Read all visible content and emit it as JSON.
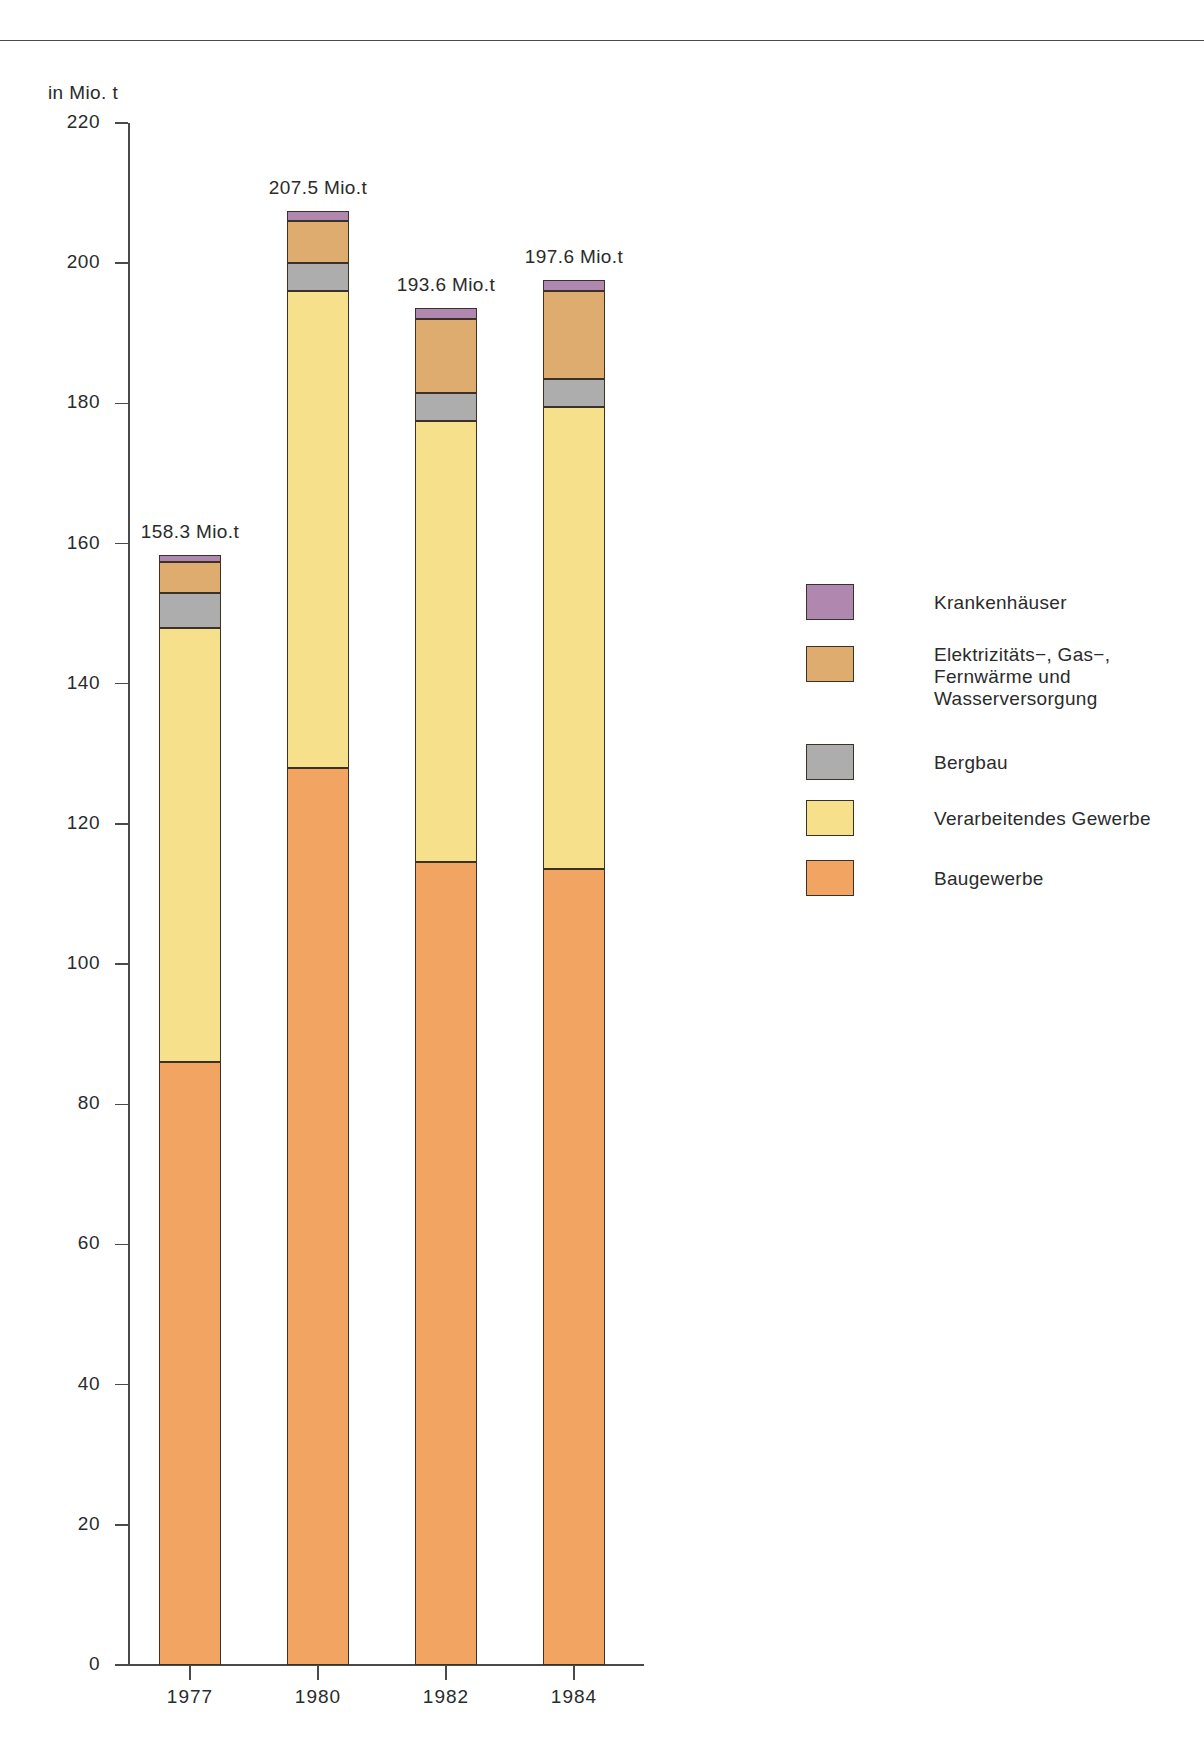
{
  "chart_data": {
    "type": "bar",
    "subtype": "stacked-bar",
    "title": "",
    "xlabel": "",
    "ylabel": "in Mio. t",
    "yunit": "in Mio. t",
    "ylim": [
      0,
      220
    ],
    "yticks": [
      0,
      20,
      40,
      60,
      80,
      100,
      120,
      140,
      160,
      180,
      200,
      220
    ],
    "ytick_labels": [
      "0",
      "20",
      "40",
      "60",
      "80",
      "100",
      "120",
      "140",
      "160",
      "180",
      "200",
      "220"
    ],
    "grid": false,
    "legend_position": "right",
    "categories": [
      "1977",
      "1980",
      "1982",
      "1984"
    ],
    "series": [
      {
        "name": "Baugewerbe",
        "color": "#f2a563",
        "values": [
          86.0,
          128.0,
          114.5,
          113.5
        ]
      },
      {
        "name": "Verarbeitendes Gewerbe",
        "color": "#f7e08c",
        "values": [
          62.0,
          68.0,
          63.0,
          66.0
        ]
      },
      {
        "name": "Bergbau",
        "color": "#adadad",
        "values": [
          5.0,
          4.0,
          4.0,
          4.0
        ]
      },
      {
        "name": "Elektrizitäts−, Gas−, Fernwärme und Wasserversorgung",
        "color": "#ddac6e",
        "values": [
          4.3,
          6.0,
          10.5,
          12.5
        ]
      },
      {
        "name": "Krankenhäuser",
        "color": "#b087ae",
        "values": [
          1.0,
          1.5,
          1.6,
          1.6
        ]
      }
    ],
    "totals": [
      158.3,
      207.5,
      193.6,
      197.6
    ],
    "total_labels": [
      "158.3 Mio.t",
      "207.5 Mio.t",
      "193.6 Mio.t",
      "197.6 Mio.t"
    ],
    "annotations": [
      "158.3 Mio.t",
      "207.5 Mio.t",
      "193.6 Mio.t",
      "197.6 Mio.t"
    ]
  },
  "legend": {
    "items": [
      {
        "label": "Krankenhäuser",
        "color": "#b087ae"
      },
      {
        "label": "Elektrizitäts−, Gas−,\nFernwärme und\nWasserversorgung",
        "color": "#ddac6e"
      },
      {
        "label": "Bergbau",
        "color": "#adadad"
      },
      {
        "label": "Verarbeitendes Gewerbe",
        "color": "#f7e08c"
      },
      {
        "label": "Baugewerbe",
        "color": "#f2a563"
      }
    ]
  },
  "colors": {
    "axis": "#4a4a4a",
    "text": "#2b2b2b",
    "outline": "#3a3128",
    "background": "#ffffff"
  }
}
